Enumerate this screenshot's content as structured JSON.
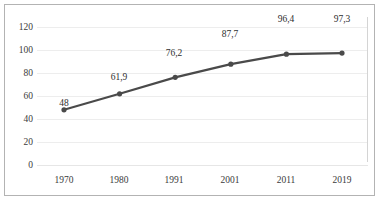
{
  "chart_data": {
    "type": "line",
    "title": "",
    "subtitle": "",
    "xlabel": "",
    "ylabel": "",
    "categories": [
      "1970",
      "1980",
      "1991",
      "2001",
      "2011",
      "2019"
    ],
    "values": [
      48,
      61.9,
      76.2,
      87.7,
      96.4,
      97.3
    ],
    "data_labels": [
      "48",
      "61,9",
      "76,2",
      "87,7",
      "96,4",
      "97,3"
    ],
    "series": [
      {
        "name": "",
        "values": [
          48,
          61.9,
          76.2,
          87.7,
          96.4,
          97.3
        ],
        "color": "#4a4a4a",
        "marker": "circle"
      }
    ],
    "ylim": [
      0,
      120
    ],
    "yticks": [
      0,
      20,
      40,
      60,
      80,
      100,
      120
    ],
    "ytick_labels": [
      "0",
      "20",
      "40",
      "60",
      "80",
      "100",
      "120"
    ],
    "grid": true,
    "grid_axis": "y",
    "grid_color": "#ededed",
    "legend": false,
    "legend_position": "none",
    "border": true,
    "border_color": "#b3b3b3",
    "background": "#ffffff"
  },
  "axes": {
    "y": {
      "ticks": [
        {
          "label": "120",
          "value": 120
        },
        {
          "label": "100",
          "value": 100
        },
        {
          "label": "80",
          "value": 80
        },
        {
          "label": "60",
          "value": 60
        },
        {
          "label": "40",
          "value": 40
        },
        {
          "label": "20",
          "value": 20
        },
        {
          "label": "0",
          "value": 0
        }
      ]
    },
    "x": {
      "ticks": [
        {
          "label": "1970"
        },
        {
          "label": "1980"
        },
        {
          "label": "1991"
        },
        {
          "label": "2001"
        },
        {
          "label": "2011"
        },
        {
          "label": "2019"
        }
      ]
    }
  }
}
